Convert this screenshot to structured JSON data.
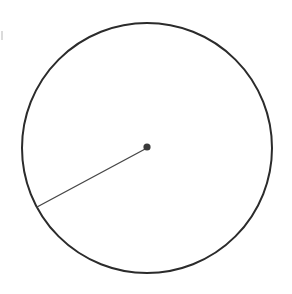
{
  "figure": {
    "title": "Circle with a single radius drawn from the center",
    "type": "geometry-diagram",
    "background_color": "#ffffff",
    "width": 292,
    "height": 294
  },
  "chart_data": {
    "type": "scatter",
    "title": "Circle with a single radius drawn from the center",
    "subtitle": "",
    "xlabel": "",
    "ylabel": "",
    "grid": false,
    "legend": null,
    "axis_visible": false,
    "tick_labels": [],
    "annotations": [],
    "shapes": [
      {
        "name": "circle-outline",
        "kind": "circle",
        "center_x": 147,
        "center_y": 148,
        "radius": 125,
        "stroke_color": "#2b2b2b",
        "stroke_width": 2,
        "fill": "none"
      },
      {
        "name": "radius-segment",
        "kind": "line",
        "x1": 147,
        "y1": 148,
        "x2": 37,
        "y2": 207,
        "angle_degrees": 208,
        "length_px": 125,
        "stroke_color": "#474747",
        "stroke_width": 1.4
      },
      {
        "name": "center-point",
        "kind": "dot",
        "center_x": 147,
        "center_y": 147,
        "radius": 3.6,
        "fill_color": "#3a3a3a"
      },
      {
        "name": "edge-artifact-mark",
        "kind": "mark",
        "x": 1,
        "y": 31,
        "width": 2,
        "height": 9,
        "fill_color": "#cfcfcf"
      }
    ]
  }
}
